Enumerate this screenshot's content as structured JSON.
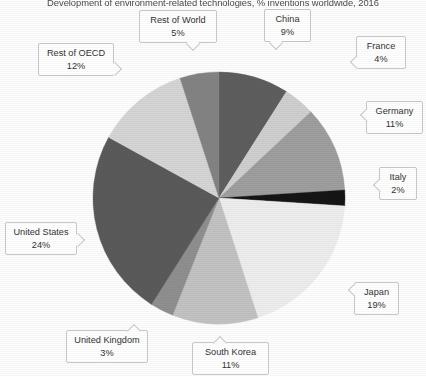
{
  "chart_title": "Development of environment-related technologies, % inventions worldwide, 2016",
  "chart_data": {
    "type": "pie",
    "title": "Development of environment-related technologies, % inventions worldwide, 2016",
    "xlabel": "",
    "ylabel": "",
    "legend_position": "callout-labels",
    "grid": false,
    "units": "% of inventions worldwide",
    "year": "2016",
    "start_angle_deg": 0,
    "direction": "clockwise",
    "categories": [
      "China",
      "France",
      "Germany",
      "Italy",
      "Japan",
      "South Korea",
      "United Kingdom",
      "United States",
      "Rest of OECD",
      "Rest of World"
    ],
    "values": [
      9,
      4,
      11,
      2,
      19,
      11,
      3,
      24,
      12,
      5
    ],
    "value_labels": [
      "9%",
      "4%",
      "11%",
      "2%",
      "19%",
      "11%",
      "3%",
      "24%",
      "12%",
      "5%"
    ],
    "colors": [
      "#5e5e5e",
      "#cfcfcf",
      "#9e9e9e",
      "#151515",
      "#ededed",
      "#c2c2c2",
      "#8f8f8f",
      "#5a5a5a",
      "#d5d5d5",
      "#838383"
    ],
    "slices": [
      {
        "label": "China",
        "value": 9,
        "value_label": "9%",
        "color": "#5e5e5e"
      },
      {
        "label": "France",
        "value": 4,
        "value_label": "4%",
        "color": "#cfcfcf"
      },
      {
        "label": "Germany",
        "value": 11,
        "value_label": "11%",
        "color": "#9e9e9e"
      },
      {
        "label": "Italy",
        "value": 2,
        "value_label": "2%",
        "color": "#151515"
      },
      {
        "label": "Japan",
        "value": 19,
        "value_label": "19%",
        "color": "#ededed"
      },
      {
        "label": "South Korea",
        "value": 11,
        "value_label": "11%",
        "color": "#c2c2c2"
      },
      {
        "label": "United Kingdom",
        "value": 3,
        "value_label": "3%",
        "color": "#8f8f8f"
      },
      {
        "label": "United States",
        "value": 24,
        "value_label": "24%",
        "color": "#5a5a5a"
      },
      {
        "label": "Rest of OECD",
        "value": 12,
        "value_label": "12%",
        "color": "#d5d5d5"
      },
      {
        "label": "Rest of World",
        "value": 5,
        "value_label": "5%",
        "color": "#838383"
      }
    ],
    "total": 100
  },
  "callouts": {
    "rest_of_world": {
      "name": "Rest of World",
      "value": "5%"
    },
    "china": {
      "name": "China",
      "value": "9%"
    },
    "france": {
      "name": "France",
      "value": "4%"
    },
    "germany": {
      "name": "Germany",
      "value": "11%"
    },
    "italy": {
      "name": "Italy",
      "value": "2%"
    },
    "japan": {
      "name": "Japan",
      "value": "19%"
    },
    "south_korea": {
      "name": "South Korea",
      "value": "11%"
    },
    "united_kingdom": {
      "name": "United Kingdom",
      "value": "3%"
    },
    "united_states": {
      "name": "United States",
      "value": "24%"
    },
    "rest_of_oecd": {
      "name": "Rest of OECD",
      "value": "12%"
    }
  }
}
